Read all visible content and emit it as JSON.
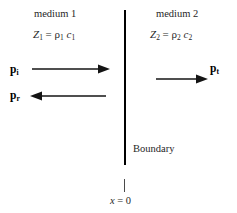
{
  "figure": {
    "background_color": "#ffffff",
    "line_color": "#000000",
    "width": 237,
    "height": 213
  },
  "left_region": {
    "medium_label": "medium 1",
    "impedance": {
      "symbol": "Z",
      "symbol_subscript": "1",
      "equals": "=",
      "density": "ρ",
      "density_subscript": "1",
      "speed": "c",
      "speed_subscript": "1"
    }
  },
  "right_region": {
    "medium_label": "medium 2",
    "impedance": {
      "symbol": "Z",
      "symbol_subscript": "2",
      "equals": "=",
      "density": "ρ",
      "density_subscript": "2",
      "speed": "c",
      "speed_subscript": "2"
    }
  },
  "waves": [
    {
      "name": "incident",
      "symbol": "p",
      "subscript": "i",
      "direction": "right"
    },
    {
      "name": "reflected",
      "symbol": "p",
      "subscript": "r",
      "direction": "left"
    },
    {
      "name": "transmitted",
      "symbol": "p",
      "subscript": "t",
      "direction": "right"
    }
  ],
  "boundary": {
    "caption": "Boundary",
    "origin_variable": "x",
    "origin_equals": "=",
    "origin_value": "0"
  }
}
